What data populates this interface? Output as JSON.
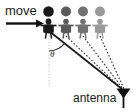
{
  "figure": {
    "title": "move",
    "type": "schematic-diagram",
    "background_color": "#ffffff",
    "width": 139,
    "height": 112
  },
  "labels": {
    "move": "move",
    "antenna": "antenna",
    "theta": "θ"
  },
  "icons": {
    "move_arrow": "right-arrow-icon",
    "antenna": "antenna-icon",
    "person": "person-icon",
    "angle": "angle-arc-icon"
  },
  "colors": {
    "person_1": "#1a1a1a",
    "person_2": "#5a5a5a",
    "person_3": "#727272",
    "person_4": "#9a9a9a",
    "arrow": "#111111",
    "solid_ray": "#1a1a1a",
    "dashed_ray": "#2b2b2b",
    "reference_line": "#c8c8c8",
    "antenna": "#111111",
    "text": "#1a1a1a"
  },
  "people": [
    {
      "id": "person-1",
      "label": "person-position-1",
      "x": 48,
      "color": "#1a1a1a",
      "ray_style": "solid"
    },
    {
      "id": "person-2",
      "label": "person-position-2",
      "x": 66,
      "color": "#5a5a5a",
      "ray_style": "dashed"
    },
    {
      "id": "person-3",
      "label": "person-position-3",
      "x": 83,
      "color": "#727272",
      "ray_style": "dashed"
    },
    {
      "id": "person-4",
      "label": "person-position-4",
      "x": 100,
      "color": "#9a9a9a",
      "ray_style": "dashed"
    }
  ],
  "antenna_position": {
    "x": 124,
    "y": 92
  },
  "move_arrow": {
    "x1": 6,
    "y1": 23,
    "x2": 43,
    "y2": 23
  },
  "reference_line": {
    "x1": 49,
    "y1": 30,
    "x2": 49,
    "y2": 86
  },
  "angle_arc": {
    "center_x": 49,
    "center_y": 30,
    "radius": 21,
    "label": "θ"
  }
}
